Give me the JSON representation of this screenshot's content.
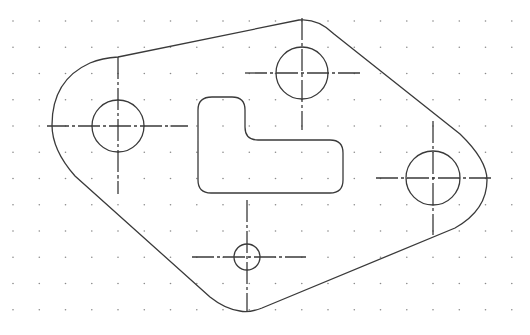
{
  "drawing": {
    "type": "cad-2d-plate",
    "background": "#ffffff",
    "stroke_color": "#3a3a3a",
    "grid": {
      "dot_color": "#8a8a8a",
      "origin_x": 13,
      "origin_y": 21,
      "spacing": 26.25,
      "cols": 20,
      "rows": 12
    },
    "holes": [
      {
        "name": "hole-left",
        "cx": 118,
        "cy": 126,
        "r": 26,
        "h": [
          47,
          188
        ],
        "v": [
          57,
          194
        ]
      },
      {
        "name": "hole-top",
        "cx": 302,
        "cy": 73,
        "r": 26,
        "h": [
          245,
          360
        ],
        "v": [
          18,
          130
        ]
      },
      {
        "name": "hole-right",
        "cx": 433,
        "cy": 178,
        "r": 27,
        "h": [
          376,
          492
        ],
        "v": [
          121,
          235
        ]
      },
      {
        "name": "hole-bottom",
        "cx": 247,
        "cy": 257,
        "r": 13,
        "h": [
          192,
          306
        ],
        "v": [
          200,
          312
        ]
      }
    ],
    "slot_path": "M 212 97 L 232 97 Q 245 97 245 110 L 245 127 Q 245 140 258 140 L 330 140 Q 343 140 343 153 L 343 180 Q 343 193 330 193 L 211 193 Q 198 193 198 180 L 198 110 Q 198 97 212 97 Z",
    "outline_path": "M 118 57 L 299 20 Q 318 18 334 34 L 460 134 Q 487 160 487 180 Q 487 210 455 228 L 262 308 Q 249 313 240 311 Q 225 309 210 297 L 75 176 Q 52 150 52 125 Q 52 80 90 63 Q 102 58 118 57 Z"
  }
}
